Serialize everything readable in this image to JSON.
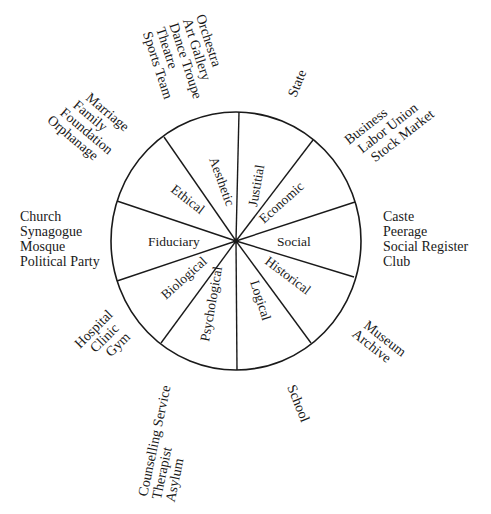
{
  "diagram": {
    "type": "wheel",
    "center": [
      236,
      241
    ],
    "sectors": [
      {
        "id": "justitial",
        "label": "Justitial",
        "institutions": [
          "State"
        ]
      },
      {
        "id": "economic",
        "label": "Economic",
        "institutions": [
          "Business",
          "Labor Union",
          "Stock Market"
        ]
      },
      {
        "id": "social",
        "label": "Social",
        "institutions": [
          "Caste",
          "Peerage",
          "Social Register",
          "Club"
        ]
      },
      {
        "id": "historical",
        "label": "Historical",
        "institutions": [
          "Museum",
          "Archive"
        ]
      },
      {
        "id": "logical",
        "label": "Logical",
        "institutions": [
          "School"
        ]
      },
      {
        "id": "psychological",
        "label": "Psychological",
        "institutions": [
          "Counselling Service",
          "Therapist",
          "Asylum"
        ]
      },
      {
        "id": "biological",
        "label": "Biological",
        "institutions": [
          "Hospital",
          "Clinic",
          "Gym"
        ]
      },
      {
        "id": "fiduciary",
        "label": "Fiduciary",
        "institutions": [
          "Church",
          "Synagogue",
          "Mosque",
          "Political Party"
        ]
      },
      {
        "id": "ethical",
        "label": "Ethical",
        "institutions": [
          "Marriage",
          "Family",
          "Foundation",
          "Orphanage"
        ]
      },
      {
        "id": "aesthetic",
        "label": "Aesthetic",
        "institutions": [
          "Orchestra",
          "Art Gallery",
          "Dance Troupe",
          "Theatre",
          "Sports Team"
        ]
      }
    ]
  },
  "labels": {
    "justitial": "Justitial",
    "economic": "Economic",
    "social": "Social",
    "historical": "Historical",
    "logical": "Logical",
    "psychological": "Psychological",
    "biological": "Biological",
    "fiduciary": "Fiduciary",
    "ethical": "Ethical",
    "aesthetic": "Aesthetic"
  },
  "outer": {
    "state": [
      "State"
    ],
    "economic": [
      "Business",
      "Labor Union",
      "Stock Market"
    ],
    "social": [
      "Caste",
      "Peerage",
      "Social Register",
      "Club"
    ],
    "historical": [
      "Museum",
      "Archive"
    ],
    "logical": [
      "School"
    ],
    "psychological": [
      "Counselling Service",
      "Therapist",
      "Asylum"
    ],
    "biological": [
      "Hospital",
      "Clinic",
      "Gym"
    ],
    "fiduciary": [
      "Church",
      "Synagogue",
      "Mosque",
      "Political Party"
    ],
    "ethical": [
      "Marriage",
      "Family",
      "Foundation",
      "Orphanage"
    ],
    "aesthetic": [
      "Orchestra",
      "Art Gallery",
      "Dance Troupe",
      "Theatre",
      "Sports Team"
    ]
  },
  "colors": {
    "stroke": "#1a1a1a",
    "background": "#ffffff"
  }
}
